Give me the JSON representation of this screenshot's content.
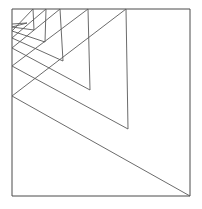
{
  "figure": {
    "background_color": "#ffffff",
    "stroke_color": "#4a4a4a",
    "spiral_stroke_color": "#5a5a5a",
    "canvas": {
      "width": 202,
      "height": 209
    },
    "frame": {
      "name": "square-border",
      "x": 12,
      "y": 9,
      "width": 178,
      "height": 187,
      "points": "12,9 190,9 190,196 12,196 12,9"
    },
    "spiral": {
      "description": "Self-similar zigzag: each spike rises from a point on the left edge up to a peak on the top edge, then descends to an inner notch vertex, forming a logarithmic spiral of triangles decreasing toward the upper-left corner.",
      "spike_count": 7,
      "peaks_on_top_edge": [
        {
          "x": 33,
          "y": 9
        },
        {
          "x": 46,
          "y": 9
        },
        {
          "x": 60,
          "y": 9
        },
        {
          "x": 88,
          "y": 9
        },
        {
          "x": 126,
          "y": 9
        }
      ],
      "left_edge_anchors": [
        {
          "x": 12,
          "y": 96
        },
        {
          "x": 12,
          "y": 66
        },
        {
          "x": 12,
          "y": 48
        },
        {
          "x": 12,
          "y": 38
        },
        {
          "x": 12,
          "y": 31
        },
        {
          "x": 12,
          "y": 27
        }
      ],
      "notch_vertices": [
        {
          "x": 190,
          "y": 196
        },
        {
          "x": 128,
          "y": 129
        },
        {
          "x": 90,
          "y": 90
        },
        {
          "x": 63,
          "y": 61
        },
        {
          "x": 45,
          "y": 42
        },
        {
          "x": 34,
          "y": 30
        },
        {
          "x": 27,
          "y": 23
        }
      ],
      "polyline_points": "190,196 12,96 126,9 128,129 12,66 88,9 90,90 12,48 60,9 63,61 12,38 46,9 45,42 12,31 33,9 34,30 12,27 27,23 12,24",
      "closing_segment": "12,196 190,196"
    }
  }
}
